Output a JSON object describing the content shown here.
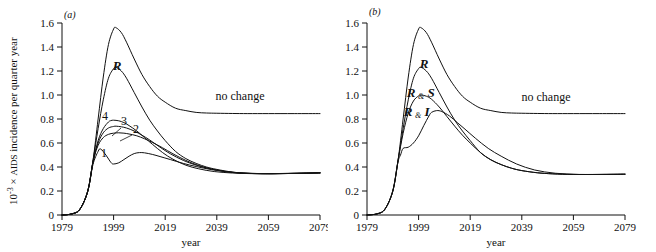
{
  "figure": {
    "axis": {
      "y_label_prefix": "10",
      "y_label_exponent": "-3",
      "y_label_times": "×",
      "y_label_smallcaps": "AIDS",
      "y_label_rest": "incidence per quarter year",
      "y_label_full": "10-3 × AIDS incidence per quarter year",
      "x_label": "year",
      "y_ticks": [
        "0",
        "0.2",
        "0.4",
        "0.6",
        "0.8",
        "1.0",
        "1.2",
        "1.4",
        "1.6"
      ],
      "x_ticks": [
        "1979",
        "1999",
        "2019",
        "2039",
        "2059",
        "2079"
      ],
      "ylim": [
        0,
        1.6
      ],
      "xlim": [
        1979,
        2079
      ]
    },
    "panels": [
      {
        "id": "a",
        "label": "(a)",
        "annotations": [
          {
            "name": "no-change",
            "text": "no change"
          },
          {
            "name": "curve-R",
            "text": "R"
          },
          {
            "name": "curve-4",
            "text": "4"
          },
          {
            "name": "curve-3",
            "text": "3"
          },
          {
            "name": "curve-2",
            "text": "2"
          },
          {
            "name": "curve-1",
            "text": "1"
          }
        ]
      },
      {
        "id": "b",
        "label": "(b)",
        "annotations": [
          {
            "name": "no-change",
            "text": "no change"
          },
          {
            "name": "curve-R",
            "text": "R"
          },
          {
            "name": "curve-RS-left",
            "text": "R"
          },
          {
            "name": "curve-RS-amp",
            "text": "&"
          },
          {
            "name": "curve-RS-right",
            "text": "S"
          },
          {
            "name": "curve-RI-left",
            "text": "R"
          },
          {
            "name": "curve-RI-amp",
            "text": "&"
          },
          {
            "name": "curve-RI-right",
            "text": "I"
          }
        ]
      }
    ]
  },
  "chart_data": {
    "type": "line",
    "title": "",
    "subtitle": "",
    "xlabel": "year",
    "ylabel": "10-3 × AIDS incidence per quarter year",
    "xlim": [
      1979,
      2079
    ],
    "ylim": [
      0,
      1.6
    ],
    "xticks": [
      1979,
      1999,
      2019,
      2039,
      2059,
      2079
    ],
    "yticks": [
      0,
      0.2,
      0.4,
      0.6,
      0.8,
      1.0,
      1.2,
      1.4,
      1.6
    ],
    "grid": false,
    "legend_position": "inline-annotations",
    "panels": [
      {
        "panel": "a",
        "panel_label": "(a)",
        "series": [
          {
            "name": "no change",
            "label": "no change",
            "peak_year": 2000,
            "peak_value": 1.56,
            "plateau_value": 0.85,
            "x": [
              1979,
              1983,
              1986,
              1989,
              1991,
              1993,
              1995,
              1997,
              1999,
              2000,
              2002,
              2004,
              2007,
              2010,
              2013,
              2016,
              2019,
              2023,
              2027,
              2031,
              2035,
              2039,
              2045,
              2051,
              2059,
              2069,
              2079
            ],
            "y": [
              0.0,
              0.01,
              0.05,
              0.2,
              0.45,
              0.8,
              1.15,
              1.42,
              1.55,
              1.56,
              1.52,
              1.44,
              1.3,
              1.17,
              1.07,
              0.99,
              0.94,
              0.89,
              0.87,
              0.855,
              0.85,
              0.848,
              0.846,
              0.845,
              0.845,
              0.845,
              0.845
            ]
          },
          {
            "name": "R",
            "label": "R",
            "peak_year": 2000,
            "peak_value": 1.23,
            "plateau_value": 0.35,
            "x": [
              1979,
              1983,
              1986,
              1989,
              1991,
              1993,
              1995,
              1997,
              1999,
              2000,
              2002,
              2004,
              2007,
              2010,
              2013,
              2016,
              2019,
              2023,
              2027,
              2031,
              2035,
              2039,
              2045,
              2051,
              2059,
              2069,
              2079
            ],
            "y": [
              0.0,
              0.01,
              0.05,
              0.2,
              0.45,
              0.72,
              0.96,
              1.14,
              1.22,
              1.23,
              1.2,
              1.14,
              1.02,
              0.9,
              0.79,
              0.7,
              0.62,
              0.53,
              0.47,
              0.43,
              0.4,
              0.38,
              0.358,
              0.348,
              0.345,
              0.348,
              0.352
            ]
          },
          {
            "name": "4",
            "label": "4",
            "peak_year": 1999,
            "peak_value": 0.79,
            "plateau_value": 0.35,
            "x": [
              1979,
              1983,
              1986,
              1989,
              1991,
              1993,
              1995,
              1997,
              1998,
              1999,
              2001,
              2003,
              2005,
              2008,
              2011,
              2014,
              2018,
              2022,
              2027,
              2032,
              2038,
              2045,
              2052,
              2060,
              2070,
              2079
            ],
            "y": [
              0.0,
              0.01,
              0.05,
              0.2,
              0.44,
              0.62,
              0.72,
              0.775,
              0.787,
              0.79,
              0.785,
              0.77,
              0.745,
              0.7,
              0.645,
              0.59,
              0.52,
              0.465,
              0.415,
              0.385,
              0.362,
              0.35,
              0.345,
              0.344,
              0.347,
              0.351
            ]
          },
          {
            "name": "3",
            "label": "3",
            "peak_year": 2000,
            "peak_value": 0.74,
            "plateau_value": 0.35,
            "x": [
              1979,
              1983,
              1986,
              1989,
              1991,
              1993,
              1995,
              1997,
              1999,
              2000,
              2002,
              2004,
              2007,
              2010,
              2013,
              2017,
              2021,
              2026,
              2031,
              2037,
              2044,
              2051,
              2060,
              2070,
              2079
            ],
            "y": [
              0.0,
              0.01,
              0.05,
              0.2,
              0.44,
              0.6,
              0.685,
              0.725,
              0.738,
              0.74,
              0.735,
              0.725,
              0.7,
              0.665,
              0.625,
              0.565,
              0.51,
              0.455,
              0.415,
              0.382,
              0.358,
              0.347,
              0.344,
              0.347,
              0.351
            ]
          },
          {
            "name": "2",
            "label": "2",
            "peak_year": 2001,
            "peak_value": 0.685,
            "plateau_value": 0.35,
            "x": [
              1979,
              1983,
              1986,
              1989,
              1991,
              1993,
              1995,
              1997,
              1999,
              2001,
              2003,
              2005,
              2008,
              2011,
              2014,
              2018,
              2022,
              2027,
              2032,
              2038,
              2045,
              2052,
              2061,
              2070,
              2079
            ],
            "y": [
              0.0,
              0.01,
              0.05,
              0.2,
              0.44,
              0.58,
              0.645,
              0.672,
              0.682,
              0.685,
              0.682,
              0.675,
              0.66,
              0.635,
              0.605,
              0.56,
              0.51,
              0.455,
              0.412,
              0.378,
              0.355,
              0.346,
              0.344,
              0.347,
              0.351
            ]
          },
          {
            "name": "1",
            "label": "1",
            "first_peak_year": 1994,
            "first_peak_value": 0.55,
            "trough_year": 1999,
            "trough_value": 0.42,
            "second_peak_year": 2009,
            "second_peak_value": 0.52,
            "plateau_value": 0.35,
            "x": [
              1979,
              1983,
              1986,
              1989,
              1991,
              1993,
              1994,
              1996,
              1998,
              1999,
              2001,
              2003,
              2005,
              2007,
              2009,
              2011,
              2014,
              2017,
              2021,
              2026,
              2031,
              2037,
              2044,
              2052,
              2061,
              2070,
              2079
            ],
            "y": [
              0.0,
              0.01,
              0.05,
              0.2,
              0.42,
              0.53,
              0.55,
              0.5,
              0.437,
              0.425,
              0.435,
              0.462,
              0.49,
              0.512,
              0.52,
              0.518,
              0.505,
              0.487,
              0.462,
              0.43,
              0.404,
              0.378,
              0.358,
              0.347,
              0.345,
              0.347,
              0.351
            ]
          }
        ]
      },
      {
        "panel": "b",
        "panel_label": "(b)",
        "series": [
          {
            "name": "no change",
            "label": "no change",
            "peak_year": 2000,
            "peak_value": 1.56,
            "plateau_value": 0.845,
            "x": [
              1979,
              1983,
              1986,
              1989,
              1991,
              1993,
              1995,
              1997,
              1999,
              2000,
              2002,
              2004,
              2007,
              2010,
              2013,
              2016,
              2019,
              2023,
              2027,
              2031,
              2035,
              2039,
              2045,
              2051,
              2059,
              2069,
              2079
            ],
            "y": [
              0.0,
              0.01,
              0.05,
              0.2,
              0.45,
              0.8,
              1.15,
              1.42,
              1.55,
              1.56,
              1.52,
              1.44,
              1.3,
              1.17,
              1.07,
              0.99,
              0.94,
              0.89,
              0.87,
              0.855,
              0.85,
              0.848,
              0.846,
              0.845,
              0.845,
              0.845,
              0.845
            ]
          },
          {
            "name": "R",
            "label": "R",
            "peak_year": 2000,
            "peak_value": 1.23,
            "plateau_value": 0.34,
            "x": [
              1979,
              1983,
              1986,
              1989,
              1991,
              1993,
              1995,
              1997,
              1999,
              2000,
              2002,
              2004,
              2007,
              2010,
              2013,
              2016,
              2019,
              2023,
              2027,
              2031,
              2035,
              2039,
              2045,
              2051,
              2059,
              2069,
              2079
            ],
            "y": [
              0.0,
              0.01,
              0.05,
              0.2,
              0.45,
              0.72,
              0.96,
              1.14,
              1.22,
              1.23,
              1.2,
              1.14,
              1.02,
              0.9,
              0.79,
              0.7,
              0.62,
              0.52,
              0.46,
              0.42,
              0.39,
              0.37,
              0.352,
              0.343,
              0.338,
              0.338,
              0.34
            ]
          },
          {
            "name": "R & S",
            "label": "R & S",
            "peak_year": 2000,
            "peak_value": 1.0,
            "plateau_value": 0.34,
            "x": [
              1979,
              1983,
              1986,
              1989,
              1991,
              1993,
              1995,
              1997,
              1999,
              2000,
              2002,
              2004,
              2007,
              2010,
              2013,
              2016,
              2019,
              2023,
              2027,
              2031,
              2035,
              2039,
              2045,
              2051,
              2059,
              2069,
              2079
            ],
            "y": [
              0.0,
              0.01,
              0.05,
              0.2,
              0.45,
              0.68,
              0.85,
              0.95,
              0.993,
              1.0,
              0.99,
              0.965,
              0.9,
              0.82,
              0.74,
              0.665,
              0.6,
              0.52,
              0.46,
              0.42,
              0.39,
              0.37,
              0.352,
              0.343,
              0.338,
              0.338,
              0.34
            ]
          },
          {
            "name": "R & I",
            "label": "R & I",
            "shoulder_year": 1993,
            "shoulder_value": 0.56,
            "peak_year": 2004,
            "peak_value": 0.87,
            "plateau_value": 0.34,
            "x": [
              1979,
              1983,
              1986,
              1989,
              1991,
              1992,
              1993,
              1995,
              1997,
              1999,
              2001,
              2003,
              2004,
              2006,
              2008,
              2011,
              2014,
              2017,
              2021,
              2026,
              2031,
              2037,
              2044,
              2052,
              2061,
              2070,
              2079
            ],
            "y": [
              0.0,
              0.01,
              0.05,
              0.2,
              0.44,
              0.5,
              0.555,
              0.565,
              0.6,
              0.66,
              0.745,
              0.825,
              0.855,
              0.87,
              0.862,
              0.825,
              0.77,
              0.715,
              0.64,
              0.555,
              0.49,
              0.425,
              0.375,
              0.348,
              0.338,
              0.338,
              0.34
            ]
          }
        ]
      }
    ]
  }
}
